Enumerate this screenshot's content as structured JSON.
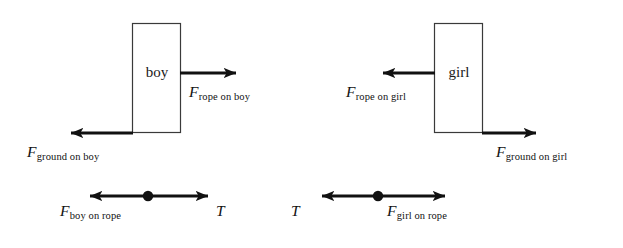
{
  "figure": {
    "background_color": "#ffffff",
    "stroke_color": "#111111",
    "width": 623,
    "height": 248
  },
  "panels": {
    "boy": {
      "body_label": "boy",
      "forces": [
        {
          "name": "rope-on-boy",
          "symbol": "F",
          "subscript": "rope on boy",
          "direction": "right"
        },
        {
          "name": "ground-on-boy",
          "symbol": "F",
          "subscript": "ground on boy",
          "direction": "left"
        }
      ]
    },
    "girl": {
      "body_label": "girl",
      "forces": [
        {
          "name": "rope-on-girl",
          "symbol": "F",
          "subscript": "rope on girl",
          "direction": "left"
        },
        {
          "name": "ground-on-girl",
          "symbol": "F",
          "subscript": "ground on girl",
          "direction": "right"
        }
      ]
    }
  },
  "rope_diagrams": {
    "left": {
      "name": "rope-segment-boy-side",
      "left_label": {
        "symbol": "F",
        "subscript": "boy on rope"
      },
      "right_label": "T"
    },
    "right": {
      "name": "rope-segment-girl-side",
      "left_label": "T",
      "right_label": {
        "symbol": "F",
        "subscript": "girl on rope"
      }
    }
  }
}
